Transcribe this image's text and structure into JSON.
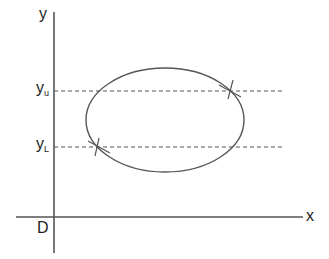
{
  "diagram": {
    "type": "ellipse-with-tangent-bounds",
    "axes": {
      "x_label": "x",
      "y_label": "y",
      "origin_label": "D"
    },
    "levels": {
      "upper": {
        "base": "y",
        "sub": "u"
      },
      "lower": {
        "base": "y",
        "sub": "L"
      }
    },
    "colors": {
      "axis": "#555555",
      "curve": "#555555",
      "dashed": "#555555",
      "text": "#222222",
      "background": "#ffffff"
    }
  }
}
